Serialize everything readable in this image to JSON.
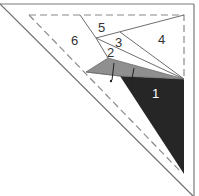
{
  "diagram": {
    "type": "paper-piecing pattern (corner triangle)",
    "colors": {
      "line": "#6e6e6e",
      "dashed": "#8a8a8a",
      "piece_dark": "#262626",
      "piece_gray": "#8f8f8f",
      "label_dark": "#333333",
      "label_light": "#ffffff"
    },
    "pieces": [
      {
        "id": "1",
        "label": "1",
        "fill": "dark"
      },
      {
        "id": "2",
        "label": "2",
        "fill": "gray"
      },
      {
        "id": "3",
        "label": "3",
        "fill": "white"
      },
      {
        "id": "4",
        "label": "4",
        "fill": "white"
      },
      {
        "id": "5",
        "label": "5",
        "fill": "white"
      },
      {
        "id": "6",
        "label": "6",
        "fill": "white"
      }
    ]
  }
}
